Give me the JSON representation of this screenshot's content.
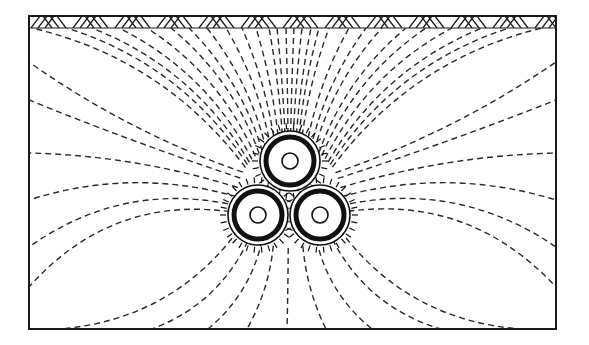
{
  "diagram": {
    "title": "Electric field lines around three-core buried cable",
    "colors": {
      "line": "#2a2a2a",
      "frame": "#1a1a1a",
      "background": "#ffffff"
    },
    "frame": {
      "x": 29,
      "y": 16,
      "width": 527,
      "height": 313
    },
    "ground_strip": {
      "y_top": 16,
      "y_bottom": 28,
      "label": "ground-surface-hatch"
    },
    "cables": [
      {
        "name": "top",
        "cx": 290,
        "cy": 161,
        "r_outer": 30,
        "r_core": 8
      },
      {
        "name": "bottom-left",
        "cx": 258,
        "cy": 215,
        "r_outer": 30,
        "r_core": 8
      },
      {
        "name": "bottom-right",
        "cx": 320,
        "cy": 215,
        "r_outer": 30,
        "r_core": 8
      }
    ],
    "bundle_center": {
      "x": 289,
      "y": 196
    },
    "field_line_ends": {
      "top": [
        32,
        67,
        92,
        119,
        147,
        171,
        189,
        207,
        226,
        242,
        256,
        269,
        277,
        286,
        294,
        302,
        311,
        319,
        329,
        349,
        366,
        382,
        406,
        426,
        452,
        482,
        509,
        542
      ],
      "left": [
        62,
        100,
        153,
        200,
        247,
        287
      ],
      "right": [
        62,
        100,
        153,
        200,
        247,
        287
      ],
      "bottom": [
        60,
        152,
        208,
        247,
        287,
        326,
        372,
        440,
        520
      ]
    }
  }
}
